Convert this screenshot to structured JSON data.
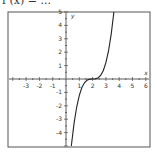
{
  "title": "f (x)  =  ...",
  "chart_data": {
    "type": "line",
    "xlabel": "x",
    "ylabel": "y",
    "xlim": [
      -4,
      6
    ],
    "ylim": [
      -5,
      5
    ],
    "x_ticks": [
      -3,
      -2,
      -1,
      1,
      2,
      3,
      4,
      5,
      6
    ],
    "y_ticks": [
      -4,
      -3,
      -2,
      -1,
      1,
      2,
      3,
      4,
      5
    ],
    "grid": false,
    "series": [
      {
        "name": "f(x)",
        "function_hint": "approximately 1.22*(x-2)^3",
        "x": [
          0.4,
          0.6,
          0.8,
          1.0,
          1.2,
          1.4,
          1.6,
          1.8,
          2.0,
          2.2,
          2.4,
          2.6,
          2.8,
          3.0,
          3.2,
          3.4,
          3.6
        ],
        "y": [
          -5.0,
          -3.35,
          -2.11,
          -1.22,
          -0.62,
          -0.26,
          -0.08,
          -0.01,
          0.0,
          0.01,
          0.08,
          0.26,
          0.62,
          1.22,
          2.11,
          3.35,
          5.0
        ]
      }
    ]
  },
  "colors": {
    "axis": "#333333",
    "curve": "#222222",
    "frame": "#555555"
  }
}
